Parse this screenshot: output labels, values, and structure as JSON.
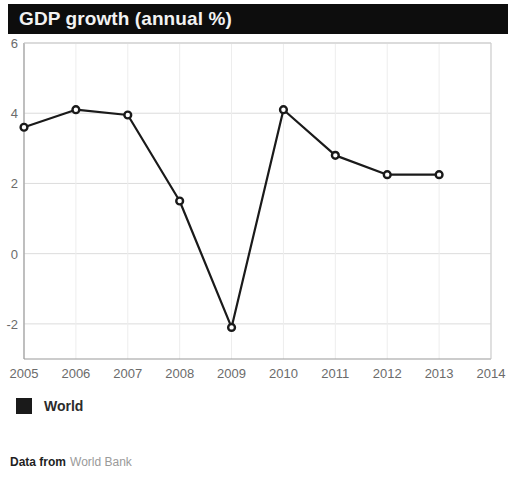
{
  "header": {
    "title": "GDP growth (annual %)"
  },
  "legend": {
    "series_label": "World",
    "swatch_color": "#1a1a1a"
  },
  "footer": {
    "label": "Data from",
    "source": "World Bank"
  },
  "chart_data": {
    "type": "line",
    "title": "GDP growth (annual %)",
    "xlabel": "",
    "ylabel": "",
    "categories": [
      "2005",
      "2006",
      "2007",
      "2008",
      "2009",
      "2010",
      "2011",
      "2012",
      "2013"
    ],
    "xticks": [
      "2005",
      "2006",
      "2007",
      "2008",
      "2009",
      "2010",
      "2011",
      "2012",
      "2013",
      "2014"
    ],
    "yticks": [
      6,
      4,
      2,
      0,
      -2
    ],
    "ylim": [
      -3,
      6
    ],
    "xlim": [
      2005,
      2014
    ],
    "grid": true,
    "legend_position": "below",
    "line_color": "#1a1a1a",
    "marker": "open-circle",
    "series": [
      {
        "name": "World",
        "values": [
          3.6,
          4.1,
          3.95,
          1.5,
          -2.1,
          4.1,
          2.8,
          2.25,
          2.25
        ]
      }
    ]
  }
}
